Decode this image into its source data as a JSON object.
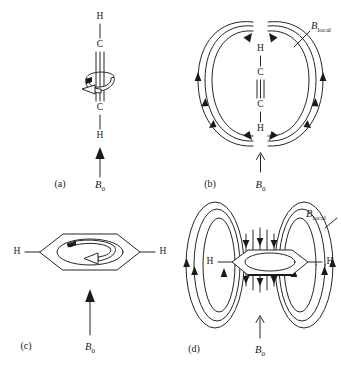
{
  "figure": {
    "background_color": "#ffffff",
    "line_color": "#262626"
  },
  "labels": {
    "b_field_symbol": "B",
    "b0_subscript": "0",
    "blocal_subscript": "local",
    "atom_h": "H",
    "atom_c": "C"
  },
  "panels": [
    {
      "id": "a",
      "label": "(a)",
      "description": "Alkyne H-C-C-H oriented vertically with circulating electron current around the triple bond, external field B0 arrow pointing up",
      "molecule": {
        "type": "alkyne",
        "orientation": "vertical",
        "atoms": [
          "H",
          "C",
          "C",
          "H"
        ],
        "bond_between_carbons": "triple"
      },
      "b0": {
        "label": "B",
        "subscript": "0",
        "direction": "up"
      },
      "has_local_field": false,
      "electron_circulation": true
    },
    {
      "id": "b",
      "label": "(b)",
      "description": "Alkyne H-C-C-H with induced local magnetic field loops (Blocal) on both sides, external field B0 arrow pointing up from below",
      "molecule": {
        "type": "alkyne",
        "orientation": "vertical",
        "atoms": [
          "H",
          "C",
          "C",
          "H"
        ],
        "bond_between_carbons": "triple"
      },
      "b0": {
        "label": "B",
        "subscript": "0",
        "direction": "up"
      },
      "local_field": {
        "label": "B",
        "subscript": "local"
      },
      "field_loops_per_side": 3,
      "has_local_field": true,
      "electron_circulation": false
    },
    {
      "id": "c",
      "label": "(c)",
      "description": "Benzene ring seen edge-on with two H substituents and a circulating ring current arrow inside, external field B0 arrow pointing up",
      "molecule": {
        "type": "benzene",
        "orientation": "edge-on-perspective",
        "substituents": [
          "H",
          "H"
        ],
        "ring_current": true
      },
      "b0": {
        "label": "B",
        "subscript": "0",
        "direction": "up"
      },
      "has_local_field": false,
      "electron_circulation": true
    },
    {
      "id": "d",
      "label": "(d)",
      "description": "Benzene ring with induced local magnetic field loops (Blocal) above and below the ring plane, external field B0 arrow pointing up",
      "molecule": {
        "type": "benzene",
        "orientation": "edge-on-perspective",
        "substituents": [
          "H",
          "H"
        ],
        "ring_current": false
      },
      "b0": {
        "label": "B",
        "subscript": "0",
        "direction": "up"
      },
      "local_field": {
        "label": "B",
        "subscript": "local"
      },
      "field_loops_per_side": 3,
      "has_local_field": true,
      "electron_circulation": false
    }
  ]
}
